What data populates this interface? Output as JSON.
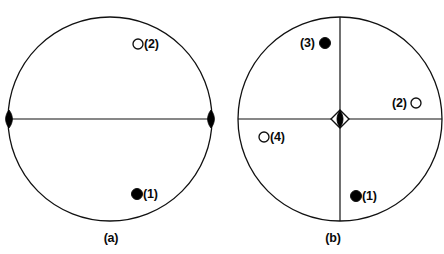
{
  "figure": {
    "background_color": "#ffffff",
    "stroke_color": "#111111",
    "fill_color": "#000000",
    "width": 444,
    "height": 254
  },
  "panels": [
    {
      "id": "a",
      "caption": "(a)",
      "circle": {
        "cx": 110,
        "cy": 119,
        "r": 102
      },
      "lines": [
        {
          "name": "horizontal-diameter",
          "x1": 8,
          "y1": 119,
          "x2": 212,
          "y2": 119
        }
      ],
      "edge_markers": [
        {
          "name": "left-edge-lens",
          "cx": 9,
          "cy": 119,
          "rx": 4.5,
          "ry": 9,
          "style": "filled-lens"
        },
        {
          "name": "right-edge-lens",
          "cx": 211,
          "cy": 119,
          "rx": 4.5,
          "ry": 9,
          "style": "filled-lens"
        }
      ],
      "markers": [
        {
          "id": "m2",
          "label": "(2)",
          "style": "open",
          "cx": 138,
          "cy": 44,
          "r": 5,
          "label_side": "right",
          "label_x": 144,
          "label_y": 38
        },
        {
          "id": "m1",
          "label": "(1)",
          "style": "filled",
          "cx": 137,
          "cy": 194,
          "r": 5.5,
          "label_side": "right",
          "label_x": 143,
          "label_y": 188
        }
      ]
    },
    {
      "id": "b",
      "caption": "(b)",
      "circle": {
        "cx": 118,
        "cy": 119,
        "r": 102
      },
      "lines": [
        {
          "name": "horizontal-diameter",
          "x1": 16,
          "y1": 119,
          "x2": 220,
          "y2": 119
        },
        {
          "name": "vertical-diameter",
          "x1": 118,
          "y1": 17,
          "x2": 118,
          "y2": 221
        }
      ],
      "center_marker": {
        "name": "center-diamond-lens",
        "cx": 118,
        "cy": 119,
        "diamond_half": 9,
        "lens_rx": 4,
        "lens_ry": 8.5
      },
      "markers": [
        {
          "id": "m3",
          "label": "(3)",
          "style": "filled",
          "cx": 103,
          "cy": 43,
          "r": 5.5,
          "label_side": "left",
          "label_x": 78,
          "label_y": 37
        },
        {
          "id": "m2",
          "label": "(2)",
          "style": "open",
          "cx": 194,
          "cy": 103,
          "r": 5,
          "label_side": "left",
          "label_x": 170,
          "label_y": 97
        },
        {
          "id": "m4",
          "label": "(4)",
          "style": "open",
          "cx": 42,
          "cy": 137,
          "r": 5,
          "label_side": "right",
          "label_x": 48,
          "label_y": 131
        },
        {
          "id": "m1",
          "label": "(1)",
          "style": "filled",
          "cx": 134,
          "cy": 196,
          "r": 5.5,
          "label_side": "right",
          "label_x": 140,
          "label_y": 190
        }
      ]
    }
  ],
  "caption_y": 232
}
